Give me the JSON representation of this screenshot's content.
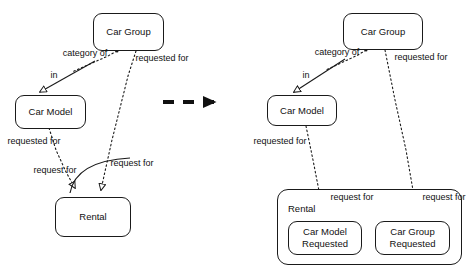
{
  "diagram": {
    "type": "uml-transformation",
    "title_artifact": "",
    "transform_arrow": {
      "name": "transformation-arrow",
      "style": "thick-dashed-with-solid-arrowhead"
    },
    "left": {
      "name": "before-model",
      "nodes": {
        "car_group": "Car Group",
        "car_model": "Car Model",
        "rental": "Rental"
      },
      "edges": [
        {
          "id": "category-of",
          "label_line1": "category",
          "label_line2": "of",
          "style": "dotted"
        },
        {
          "id": "in",
          "label_line1": "in",
          "label_line2": "",
          "style": "solid"
        },
        {
          "id": "requested-for-group",
          "label_line1": "requested",
          "label_line2": "for",
          "style": "dotted"
        },
        {
          "id": "requested-for-model",
          "label_line1": "requested",
          "label_line2": "for",
          "style": "dotted"
        },
        {
          "id": "request-for-left",
          "label_line1": "request",
          "label_line2": "for",
          "style": "dotted"
        },
        {
          "id": "request-for-right",
          "label_line1": "request",
          "label_line2": "for",
          "style": "dotted"
        }
      ]
    },
    "right": {
      "name": "after-model",
      "nodes": {
        "car_group": "Car Group",
        "car_model": "Car Model",
        "rental": "Rental",
        "car_model_requested_l1": "Car Model",
        "car_model_requested_l2": "Requested",
        "car_group_requested_l1": "Car Group",
        "car_group_requested_l2": "Requested"
      },
      "edges": [
        {
          "id": "category-of",
          "label_line1": "category",
          "label_line2": "of",
          "style": "dotted"
        },
        {
          "id": "in",
          "label_line1": "in",
          "label_line2": "",
          "style": "solid"
        },
        {
          "id": "requested-for-group",
          "label_line1": "requested",
          "label_line2": "for",
          "style": "dotted"
        },
        {
          "id": "requested-for-model",
          "label_line1": "requested",
          "label_line2": "for",
          "style": "dotted"
        },
        {
          "id": "request-for-model",
          "label_line1": "request",
          "label_line2": "for",
          "style": "dotted"
        },
        {
          "id": "request-for-group",
          "label_line1": "request",
          "label_line2": "for",
          "style": "dotted"
        }
      ]
    },
    "colors": {
      "stroke": "#1a1a1a",
      "text": "#111111",
      "background": "#ffffff"
    }
  }
}
